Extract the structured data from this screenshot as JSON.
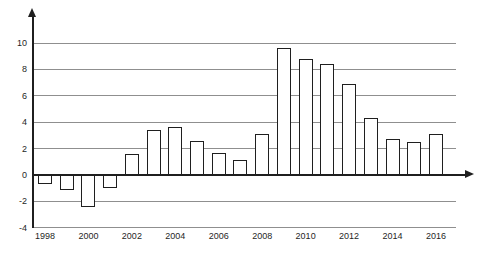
{
  "chart_data": {
    "type": "bar",
    "title": "",
    "xlabel": "",
    "ylabel": "",
    "categories": [
      1998,
      1999,
      2000,
      2001,
      2002,
      2003,
      2004,
      2005,
      2006,
      2007,
      2008,
      2009,
      2010,
      2011,
      2012,
      2013,
      2014,
      2015,
      2016
    ],
    "values": [
      -0.7,
      -1.1,
      -2.4,
      -1.0,
      1.6,
      3.4,
      3.6,
      2.6,
      1.7,
      1.1,
      3.1,
      9.6,
      8.8,
      8.4,
      6.9,
      4.3,
      2.7,
      2.5,
      3.1
    ],
    "x_tick_labels": [
      "1998",
      "2000",
      "2002",
      "2004",
      "2006",
      "2008",
      "2010",
      "2012",
      "2014",
      "2016"
    ],
    "y_ticks": [
      10,
      8,
      6,
      4,
      2,
      0,
      -2,
      -4
    ],
    "ylim": [
      -4.8,
      11.6
    ],
    "grid": true,
    "legend_position": "none",
    "colors": {
      "bar_fill": "#ffffff",
      "bar_border": "#1f1f1f",
      "gridline": "#8f8f8f",
      "axis": "#1f1f1f",
      "label_text": "#1f1f1f",
      "background": "#ffffff"
    }
  }
}
